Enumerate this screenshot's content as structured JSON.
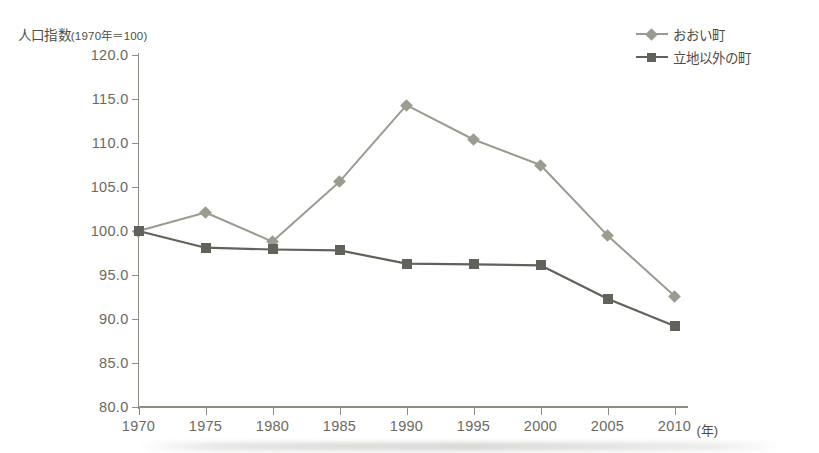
{
  "chart_data": {
    "type": "line",
    "title": "",
    "ylabel": "人口指数(1970年＝100)",
    "ylabel_main": "人口指数",
    "ylabel_paren": "(1970年＝100)",
    "xlabel": "",
    "x_unit": "(年)",
    "categories": [
      1970,
      1975,
      1980,
      1985,
      1990,
      1995,
      2000,
      2005,
      2010
    ],
    "x_tick_labels": [
      "1970",
      "1975",
      "1980",
      "1985",
      "1990",
      "1995",
      "2000",
      "2005",
      "2010"
    ],
    "ylim": [
      80.0,
      120.0
    ],
    "ytick_step": 5.0,
    "y_tick_labels": [
      "120.0",
      "115.0",
      "110.0",
      "105.0",
      "100.0",
      "95.0",
      "90.0",
      "85.0",
      "80.0"
    ],
    "y_tick_values": [
      120.0,
      115.0,
      110.0,
      105.0,
      100.0,
      95.0,
      90.0,
      85.0,
      80.0
    ],
    "grid": false,
    "legend_position": "top-right",
    "series": [
      {
        "name": "おおい町",
        "marker": "diamond",
        "color": "#9b9b8f",
        "values": [
          100.0,
          102.1,
          98.8,
          105.6,
          114.3,
          110.4,
          107.5,
          99.5,
          92.6
        ]
      },
      {
        "name": "立地以外の町",
        "marker": "square",
        "color": "#62625a",
        "values": [
          100.0,
          98.1,
          97.9,
          97.8,
          96.3,
          96.2,
          96.1,
          92.3,
          89.2
        ]
      }
    ]
  },
  "colors": {
    "axis": "#8d8d84",
    "tick_text": "#6a6a62",
    "label_text": "#4e4e46",
    "series1": "#9b9b8f",
    "series2": "#62625a",
    "background": "#ffffff"
  }
}
